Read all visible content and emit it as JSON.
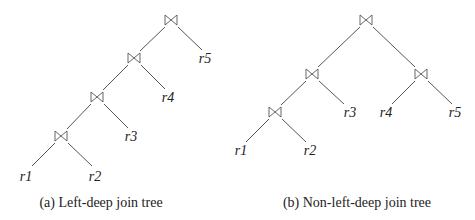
{
  "join_symbol": "bowtie-join-icon",
  "trees": [
    {
      "id": "a",
      "caption": "(a) Left-deep join tree",
      "joins": [
        {
          "x": 171,
          "y": 20
        },
        {
          "x": 134,
          "y": 58
        },
        {
          "x": 97,
          "y": 97
        },
        {
          "x": 61,
          "y": 136
        }
      ],
      "leaves": [
        {
          "label": "r5",
          "x": 205,
          "y": 63
        },
        {
          "label": "r4",
          "x": 168,
          "y": 102
        },
        {
          "label": "r3",
          "x": 131,
          "y": 141
        },
        {
          "label": "r1",
          "x": 26,
          "y": 181
        },
        {
          "label": "r2",
          "x": 95,
          "y": 181
        }
      ]
    },
    {
      "id": "b",
      "caption": "(b) Non-left-deep join tree",
      "joins": [
        {
          "x": 366,
          "y": 20
        },
        {
          "x": 312,
          "y": 74
        },
        {
          "x": 275,
          "y": 112
        },
        {
          "x": 421,
          "y": 74
        }
      ],
      "leaves": [
        {
          "label": "r3",
          "x": 350,
          "y": 117
        },
        {
          "label": "r4",
          "x": 386,
          "y": 117
        },
        {
          "label": "r5",
          "x": 455,
          "y": 117
        },
        {
          "label": "r1",
          "x": 241,
          "y": 155
        },
        {
          "label": "r2",
          "x": 310,
          "y": 155
        }
      ]
    }
  ]
}
